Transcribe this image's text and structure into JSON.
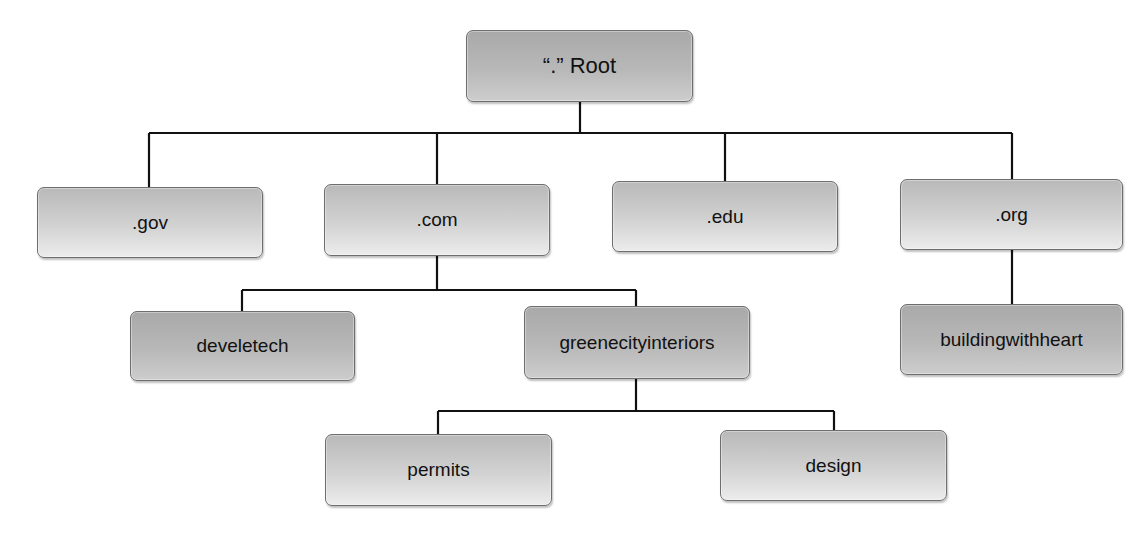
{
  "diagram": {
    "root": {
      "label": "“.” Root"
    },
    "tlds": [
      {
        "label": ".gov"
      },
      {
        "label": ".com"
      },
      {
        "label": ".edu"
      },
      {
        "label": ".org"
      }
    ],
    "second_level": [
      {
        "label": "develetech",
        "parent": ".com"
      },
      {
        "label": "greenecityinteriors",
        "parent": ".com"
      },
      {
        "label": "buildingwithheart",
        "parent": ".org"
      }
    ],
    "third_level": [
      {
        "label": "permits",
        "parent": "greenecityinteriors"
      },
      {
        "label": "design",
        "parent": "greenecityinteriors"
      }
    ],
    "colors": {
      "line": "#111111",
      "node_border": "#6e6e6e",
      "light_fill_top": "#b9b9b9",
      "light_fill_bottom": "#ececec",
      "dark_fill_top": "#a9a9a9",
      "dark_fill_bottom": "#cdcdcd"
    }
  }
}
